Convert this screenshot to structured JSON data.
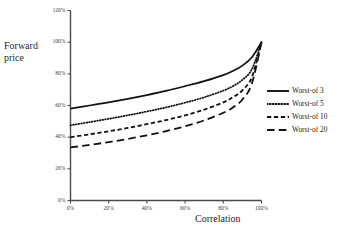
{
  "chart_data": {
    "type": "line",
    "title": "",
    "xlabel": "Correlation",
    "ylabel": "Forward price",
    "xlim": [
      0,
      100
    ],
    "ylim": [
      0,
      120
    ],
    "grid": false,
    "legend_position": "right",
    "x_tick_labels": [
      "0%",
      "20%",
      "40%",
      "60%",
      "80%",
      "100%"
    ],
    "x_ticks": [
      0,
      20,
      40,
      60,
      80,
      100
    ],
    "y_tick_labels": [
      "0%",
      "20%",
      "40%",
      "60%",
      "80%",
      "100%",
      "120%"
    ],
    "y_ticks": [
      0,
      20,
      40,
      60,
      80,
      100,
      120
    ],
    "x": [
      0,
      10,
      20,
      30,
      40,
      50,
      60,
      70,
      80,
      85,
      90,
      95,
      100
    ],
    "series": [
      {
        "name": "Worst-of 3",
        "style": "solid",
        "color": "#111111",
        "values": [
          58.0,
          60.0,
          62.0,
          64.2,
          66.6,
          69.2,
          72.2,
          75.4,
          79.2,
          81.8,
          85.2,
          90.5,
          100.0
        ]
      },
      {
        "name": "Worst-of 5",
        "style": "dotted",
        "color": "#111111",
        "values": [
          47.5,
          49.5,
          51.6,
          53.8,
          56.2,
          58.8,
          61.8,
          65.2,
          69.4,
          72.2,
          76.2,
          83.0,
          100.0
        ]
      },
      {
        "name": "Worst-of 10",
        "style": "dashed-short",
        "color": "#111111",
        "values": [
          40.0,
          41.8,
          43.7,
          45.8,
          48.2,
          50.8,
          53.8,
          57.4,
          62.0,
          65.2,
          69.6,
          78.0,
          100.0
        ]
      },
      {
        "name": "Worst-of 20",
        "style": "dashed-long",
        "color": "#111111",
        "values": [
          33.5,
          35.1,
          36.9,
          38.9,
          41.2,
          43.8,
          46.9,
          50.6,
          55.4,
          58.8,
          63.8,
          74.0,
          100.0
        ]
      }
    ]
  },
  "legend": {
    "items": [
      {
        "label": "Worst-of 3"
      },
      {
        "label": "Worst-of 5"
      },
      {
        "label": "Worst-of 10"
      },
      {
        "label": "Worst-of 20"
      }
    ]
  },
  "axis_titles": {
    "y_line1": "Forward",
    "y_line2": "price",
    "x": "Correlation"
  }
}
